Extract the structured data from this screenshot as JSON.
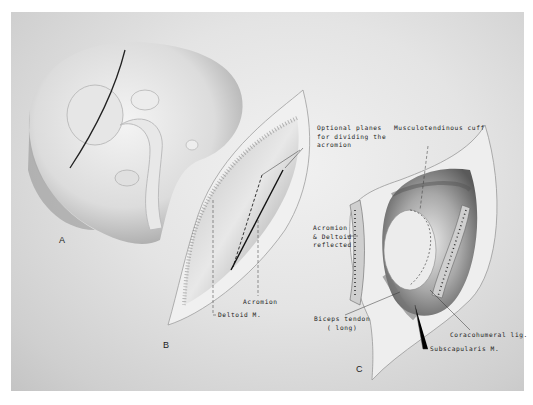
{
  "figure": {
    "panels": [
      {
        "id": "A",
        "label": "A"
      },
      {
        "id": "B",
        "label": "B"
      },
      {
        "id": "C",
        "label": "C"
      }
    ],
    "labels": {
      "optional_planes": "Optional planes\nfor dividing the\nacromion",
      "musculotendinous_cuff": "Musculotendinous cuff",
      "acromion": "Acromion",
      "deltoid": "Deltoid M.",
      "acromion_deltoid_reflected": "Acromion\n& Deltoid\nreflected",
      "biceps_tendon": "Biceps tendon\n( long)",
      "coracohumeral_lig": "Coracohumeral lig.",
      "subscapularis": "Subscapularis M."
    }
  }
}
